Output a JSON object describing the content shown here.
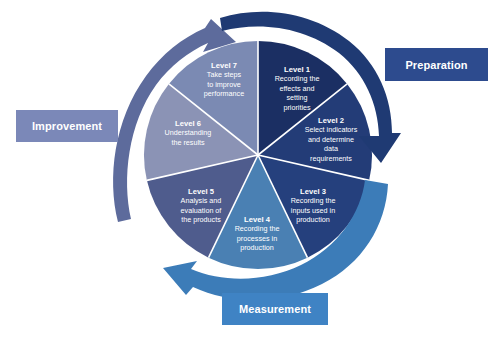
{
  "diagram": {
    "type": "cycle-wheel",
    "background_color": "#ffffff",
    "center": {
      "x": 258,
      "y": 155
    },
    "radius": 114,
    "segment_count": 7,
    "segment_gap_color": "#ffffff",
    "segments": [
      {
        "id": "level-1",
        "title": "Level 1",
        "lines": [
          "Recording the",
          "effects and",
          "setting",
          "priorities"
        ],
        "color": "#1b2f63",
        "start_angle_deg": 0,
        "end_angle_deg": 51.43,
        "label_x": 297,
        "label_y": 72
      },
      {
        "id": "level-2",
        "title": "Level 2",
        "lines": [
          "Select indicators",
          "and determine",
          "data",
          "requirements"
        ],
        "color": "#233c77",
        "start_angle_deg": 51.43,
        "end_angle_deg": 102.86,
        "label_x": 331,
        "label_y": 123
      },
      {
        "id": "level-3",
        "title": "Level 3",
        "lines": [
          "Recording the",
          "inputs used in",
          "production"
        ],
        "color": "#25407d",
        "start_angle_deg": 102.86,
        "end_angle_deg": 154.29,
        "label_x": 313,
        "label_y": 194
      },
      {
        "id": "level-4",
        "title": "Level 4",
        "lines": [
          "Recording the",
          "processes in",
          "production"
        ],
        "color": "#4a80b3",
        "start_angle_deg": 154.29,
        "end_angle_deg": 205.71,
        "label_x": 257,
        "label_y": 222
      },
      {
        "id": "level-5",
        "title": "Level 5",
        "lines": [
          "Analysis and",
          "evaluation of",
          "the products"
        ],
        "color": "#4f5c8d",
        "start_angle_deg": 205.71,
        "end_angle_deg": 257.14,
        "label_x": 201,
        "label_y": 194
      },
      {
        "id": "level-6",
        "title": "Level 6",
        "lines": [
          "Understanding",
          "the results"
        ],
        "color": "#8b93b5",
        "start_angle_deg": 257.14,
        "end_angle_deg": 308.57,
        "label_x": 188,
        "label_y": 126
      },
      {
        "id": "level-7",
        "title": "Level 7",
        "lines": [
          "Take steps",
          "to improve",
          "performance"
        ],
        "color": "#7b8ab3",
        "start_angle_deg": 308.57,
        "end_angle_deg": 360,
        "label_x": 224,
        "label_y": 68
      }
    ],
    "arrows": [
      {
        "id": "arrow-improvement",
        "name": "improvement-arrow",
        "color": "#5d6b9c",
        "direction": "clockwise-up-right",
        "points_to": "Improvement"
      },
      {
        "id": "arrow-preparation",
        "name": "preparation-arrow",
        "color": "#1f3a73",
        "direction": "clockwise-down-right",
        "points_to": "Preparation"
      },
      {
        "id": "arrow-measurement",
        "name": "measurement-arrow",
        "color": "#3c7cb8",
        "direction": "clockwise-up-left",
        "points_to": "Measurement"
      }
    ],
    "callouts": [
      {
        "id": "preparation",
        "label": "Preparation",
        "color": "#2d4b8e",
        "text_color": "#ffffff",
        "position": "right"
      },
      {
        "id": "improvement",
        "label": "Improvement",
        "color": "#7b88b8",
        "text_color": "#ffffff",
        "position": "left"
      },
      {
        "id": "measurement",
        "label": "Measurement",
        "color": "#3f83c4",
        "text_color": "#ffffff",
        "position": "bottom"
      }
    ]
  }
}
